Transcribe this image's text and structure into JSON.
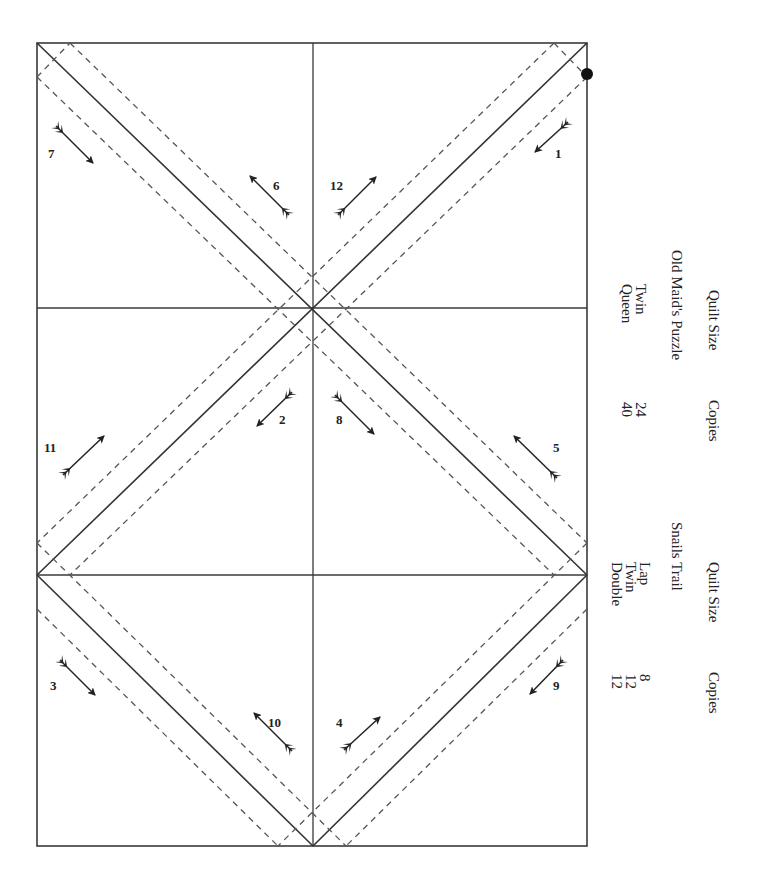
{
  "page": {
    "top_text_fragment": "g                              p"
  },
  "frame": {
    "left": 37,
    "top": 43,
    "right": 587,
    "bottom": 846,
    "mid_x": 313,
    "row1_y": 308,
    "row2_y": 575,
    "line_color": "#3a3a3a",
    "dash_color": "#555555",
    "start_dot": {
      "x": 587,
      "y": 74
    }
  },
  "pieces": [
    {
      "label": "1",
      "x": 558,
      "y": 158
    },
    {
      "label": "2",
      "x": 283,
      "y": 424
    },
    {
      "label": "3",
      "x": 54,
      "y": 690
    },
    {
      "label": "4",
      "x": 340,
      "y": 727
    },
    {
      "label": "5",
      "x": 557,
      "y": 452
    },
    {
      "label": "6",
      "x": 277,
      "y": 190
    },
    {
      "label": "7",
      "x": 52,
      "y": 158
    },
    {
      "label": "8",
      "x": 340,
      "y": 424
    },
    {
      "label": "9",
      "x": 557,
      "y": 690
    },
    {
      "label": "10",
      "x": 273,
      "y": 727
    },
    {
      "label": "11",
      "x": 48,
      "y": 452
    },
    {
      "label": "12",
      "x": 334,
      "y": 190
    }
  ],
  "tables": [
    {
      "title": "Old Maid's Puzzle",
      "col_quilt_size": "Quilt Size",
      "col_copies": "Copies",
      "rows": [
        {
          "size": "Twin",
          "copies": "24"
        },
        {
          "size": "Queen",
          "copies": "40"
        }
      ]
    },
    {
      "title": "Snails Trail",
      "col_quilt_size": "Quilt Size",
      "col_copies": "Copies",
      "rows": [
        {
          "size": "Lap",
          "copies": "8"
        },
        {
          "size": "Twin",
          "copies": "12"
        },
        {
          "size": "Double",
          "copies": "12"
        }
      ]
    }
  ]
}
